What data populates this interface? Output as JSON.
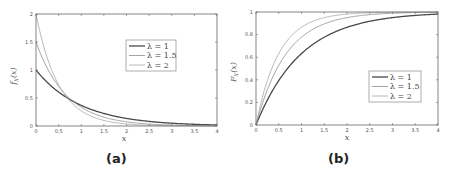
{
  "figure": {
    "captions": [
      "(a)",
      "(b)"
    ]
  },
  "colors": {
    "lambda_1": "#4a4a4a",
    "lambda_1_5": "#8c8c8c",
    "lambda_2": "#a6a6a6",
    "axes": "#555555"
  },
  "chart_data": [
    {
      "type": "line",
      "panel": "(a)",
      "title": "",
      "xlabel": "x",
      "ylabel": "f_X(x)",
      "xlim": [
        0,
        4
      ],
      "ylim": [
        0,
        2
      ],
      "xticks": [
        "0",
        "0.5",
        "1",
        "1.5",
        "2",
        "2.5",
        "3",
        "3.5",
        "4"
      ],
      "yticks": [
        "0",
        "0.5",
        "1",
        "1.5",
        "2"
      ],
      "grid": false,
      "legend_position": "upper right (inside, center-right)",
      "x": [
        0,
        0.25,
        0.5,
        0.75,
        1,
        1.5,
        2,
        2.5,
        3,
        3.5,
        4
      ],
      "series": [
        {
          "name": "λ = 1",
          "values": [
            1.0,
            0.779,
            0.607,
            0.472,
            0.368,
            0.223,
            0.135,
            0.082,
            0.05,
            0.03,
            0.018
          ]
        },
        {
          "name": "λ = 1.5",
          "values": [
            1.5,
            1.031,
            0.709,
            0.487,
            0.335,
            0.158,
            0.075,
            0.035,
            0.017,
            0.008,
            0.004
          ]
        },
        {
          "name": "λ = 2",
          "values": [
            2.0,
            1.213,
            0.736,
            0.446,
            0.271,
            0.1,
            0.037,
            0.013,
            0.005,
            0.002,
            0.001
          ]
        }
      ]
    },
    {
      "type": "line",
      "panel": "(b)",
      "title": "",
      "xlabel": "x",
      "ylabel": "F_X(x)",
      "xlim": [
        0,
        4
      ],
      "ylim": [
        0,
        1
      ],
      "xticks": [
        "0",
        "0.5",
        "1",
        "1.5",
        "2",
        "2.5",
        "3",
        "3.5",
        "4"
      ],
      "yticks": [
        "0",
        "0.2",
        "0.4",
        "0.6",
        "0.8",
        "1"
      ],
      "grid": false,
      "legend_position": "lower right (inside)",
      "x": [
        0,
        0.25,
        0.5,
        0.75,
        1,
        1.5,
        2,
        2.5,
        3,
        3.5,
        4
      ],
      "series": [
        {
          "name": "λ = 1",
          "values": [
            0,
            0.221,
            0.393,
            0.528,
            0.632,
            0.777,
            0.865,
            0.918,
            0.95,
            0.97,
            0.982
          ]
        },
        {
          "name": "λ = 1.5",
          "values": [
            0,
            0.313,
            0.528,
            0.675,
            0.777,
            0.895,
            0.95,
            0.976,
            0.989,
            0.995,
            0.998
          ]
        },
        {
          "name": "λ = 2",
          "values": [
            0,
            0.393,
            0.632,
            0.777,
            0.865,
            0.95,
            0.982,
            0.993,
            0.998,
            0.999,
            1.0
          ]
        }
      ]
    }
  ]
}
